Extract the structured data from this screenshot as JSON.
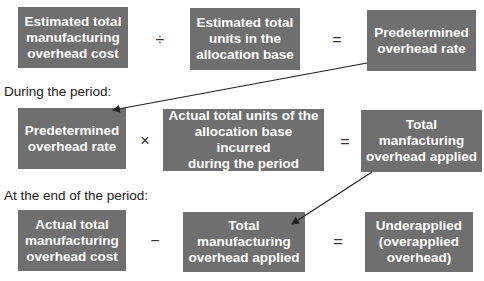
{
  "row1": {
    "box_a": "Estimated total\nmanufacturing\noverhead cost",
    "op1": "÷",
    "box_b": "Estimated total\nunits in the\nallocation base",
    "op2": "=",
    "box_c": "Predetermined\noverhead rate"
  },
  "row2": {
    "heading": "During the period:",
    "box_d": "Predetermined\noverhead rate",
    "op1": "×",
    "box_e": "Actual total units of the\nallocation base incurred\nduring the period",
    "op2": "=",
    "box_f": "Total\nmanfacturing\noverhead applied"
  },
  "row3": {
    "heading": "At the end of the period:",
    "box_g": "Actual total\nmanufacturing\noverhead cost",
    "op1": "−",
    "box_h": "Total\nmanufacturing\noverhead applied",
    "op2": "=",
    "box_i": "Underapplied\n(overapplied\noverhead)"
  },
  "colors": {
    "box_fill": "#6f6f6f",
    "box_text": "#ffffff",
    "arrow": "#222222"
  }
}
